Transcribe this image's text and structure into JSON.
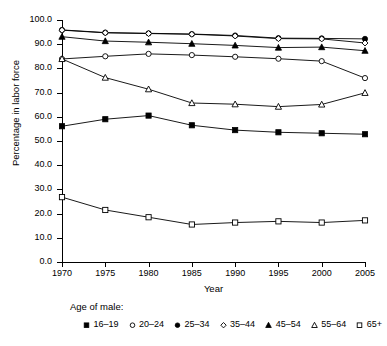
{
  "chart_data": {
    "type": "line",
    "title": "",
    "xlabel": "Year",
    "ylabel": "Percentage in labor force",
    "x": [
      1970,
      1975,
      1980,
      1985,
      1990,
      1995,
      2000,
      2005
    ],
    "xtick_labels": [
      "1970",
      "1975",
      "1980",
      "1985",
      "1990",
      "1995",
      "2000",
      "2005"
    ],
    "xlim": [
      1970,
      2005
    ],
    "ylim": [
      0.0,
      100.0
    ],
    "ytick_labels": [
      "0.0",
      "10.0",
      "20.0",
      "30.0",
      "40.0",
      "50.0",
      "60.0",
      "70.0",
      "80.0",
      "90.0",
      "100.0"
    ],
    "yticks": [
      0.0,
      10.0,
      20.0,
      30.0,
      40.0,
      50.0,
      60.0,
      70.0,
      80.0,
      90.0,
      100.0
    ],
    "grid": false,
    "legend_position": "bottom",
    "legend_title": "Age of male:",
    "series": [
      {
        "name": "16–19",
        "marker": "filled-square",
        "values": [
          56.1,
          59.0,
          60.5,
          56.5,
          54.5,
          53.6,
          53.2,
          52.8
        ]
      },
      {
        "name": "20–24",
        "marker": "open-circle",
        "values": [
          83.9,
          85.0,
          86.0,
          85.5,
          84.8,
          84.0,
          83.0,
          76.0
        ]
      },
      {
        "name": "25–34",
        "marker": "filled-circle",
        "values": [
          95.9,
          94.8,
          94.5,
          94.2,
          93.6,
          92.5,
          92.4,
          92.2
        ]
      },
      {
        "name": "35–44",
        "marker": "open-diamond",
        "values": [
          95.8,
          94.7,
          94.4,
          94.1,
          93.4,
          92.3,
          92.2,
          90.5
        ]
      },
      {
        "name": "45–54",
        "marker": "filled-triangle",
        "values": [
          93.1,
          91.3,
          90.8,
          90.2,
          89.5,
          88.6,
          88.8,
          87.3
        ]
      },
      {
        "name": "55–64",
        "marker": "open-triangle",
        "values": [
          83.9,
          76.2,
          71.4,
          65.7,
          65.2,
          64.2,
          65.1,
          69.9
        ]
      },
      {
        "name": "65+",
        "marker": "open-square",
        "values": [
          26.8,
          21.5,
          18.5,
          15.5,
          16.3,
          16.8,
          16.3,
          17.2
        ]
      }
    ]
  },
  "colors": {
    "line": "#000000",
    "axis": "#000000",
    "background": "#ffffff"
  }
}
